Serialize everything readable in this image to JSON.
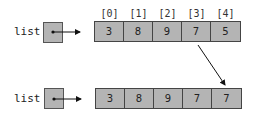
{
  "top": {
    "variable_label": "list",
    "indices": [
      "[0]",
      "[1]",
      "[2]",
      "[3]",
      "[4]"
    ],
    "values": [
      "3",
      "8",
      "9",
      "7",
      "5"
    ]
  },
  "bottom": {
    "variable_label": "list",
    "values": [
      "3",
      "8",
      "9",
      "7",
      "7"
    ]
  },
  "annotation": {
    "copy_arrow": "element [3] copied into [4]"
  },
  "colors": {
    "cell_fill": "#b4b4b4",
    "border": "#444444",
    "arrow": "#111111"
  }
}
